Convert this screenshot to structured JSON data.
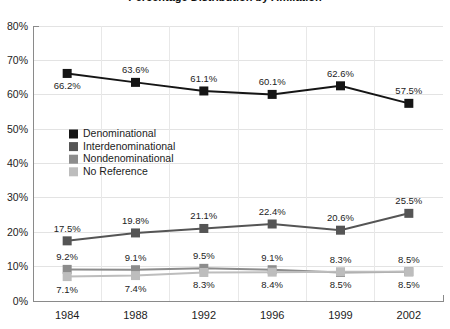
{
  "chart_data": {
    "type": "line",
    "title": "Percentage Distribution by Affiliation",
    "xlabel": "",
    "ylabel": "",
    "categories": [
      "1984",
      "1988",
      "1992",
      "1996",
      "1999",
      "2002"
    ],
    "ylim": [
      0,
      80
    ],
    "ytick_labels": [
      "0%",
      "10%",
      "20%",
      "30%",
      "40%",
      "50%",
      "60%",
      "70%",
      "80%"
    ],
    "ytick_values": [
      0,
      10,
      20,
      30,
      40,
      50,
      60,
      70,
      80
    ],
    "grid": true,
    "legend_position": "inside-upper-left",
    "series": [
      {
        "name": "Denominational",
        "color": "#151515",
        "values": [
          66.2,
          63.6,
          61.1,
          60.1,
          62.6,
          57.5
        ],
        "labels": [
          "66.2%",
          "63.6%",
          "61.1%",
          "60.1%",
          "62.6%",
          "57.5%"
        ],
        "label_positions": [
          "below",
          "above",
          "above",
          "above",
          "above",
          "above"
        ]
      },
      {
        "name": "Interdenominational",
        "color": "#555555",
        "values": [
          17.5,
          19.8,
          21.1,
          22.4,
          20.6,
          25.5
        ],
        "labels": [
          "17.5%",
          "19.8%",
          "21.1%",
          "22.4%",
          "20.6%",
          "25.5%"
        ],
        "label_positions": [
          "above",
          "above",
          "above",
          "above",
          "above",
          "above"
        ]
      },
      {
        "name": "Nondenominational",
        "color": "#8c8c8c",
        "values": [
          9.2,
          9.1,
          9.5,
          9.1,
          8.3,
          8.5
        ],
        "labels": [
          "9.2%",
          "9.1%",
          "9.5%",
          "9.1%",
          "8.3%",
          "8.5%"
        ],
        "label_positions": [
          "above",
          "above",
          "above",
          "above",
          "above",
          "above"
        ]
      },
      {
        "name": "No Reference",
        "color": "#bdbdbd",
        "values": [
          7.1,
          7.4,
          8.3,
          8.4,
          8.5,
          8.5
        ],
        "labels": [
          "7.1%",
          "7.4%",
          "8.3%",
          "8.4%",
          "8.5%",
          "8.5%"
        ],
        "label_positions": [
          "below",
          "below",
          "below",
          "below",
          "below",
          "below"
        ]
      }
    ]
  }
}
